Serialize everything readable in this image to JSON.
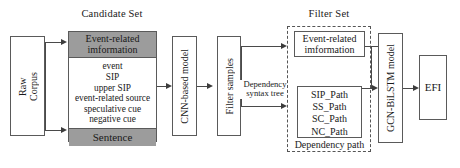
{
  "diagram": {
    "sections": {
      "candidate_set": "Candidate Set",
      "filter_set": "Filter Set"
    },
    "nodes": {
      "raw_corpus": "Raw\nCorpus",
      "raw_corpus_line1": "Raw",
      "raw_corpus_line2": "Corpus",
      "candidate_header": "Event-related\ninformation",
      "candidate_header_line1": "Event-related",
      "candidate_header_line2": "imformation",
      "candidate_items": [
        "event",
        "SIP",
        "upper SIP",
        "event-related source",
        "speculative cue",
        "negative cue"
      ],
      "candidate_footer": "Sentence",
      "cnn_model": "CNN-based model",
      "filter_samples": "Filter samples",
      "filter_header_line1": "Event-related",
      "filter_header_line2": "imformation",
      "dependency_paths": [
        "SIP_Path",
        "SS_Path",
        "SC_Path",
        "NC_Path"
      ],
      "dependency_path_caption": "Dependency path",
      "gcn_bilstm": "GCN-BiLSTM model",
      "efi": "EFI"
    },
    "edge_labels": {
      "dependency_syntax_tree_line1": "Dependency",
      "dependency_syntax_tree_line2": "syntax tree"
    },
    "colors": {
      "shaded_fill": "#9c9c9c",
      "box_stroke": "#5a5a5a",
      "connector": "#4a4a4a",
      "background": "#ffffff"
    }
  }
}
